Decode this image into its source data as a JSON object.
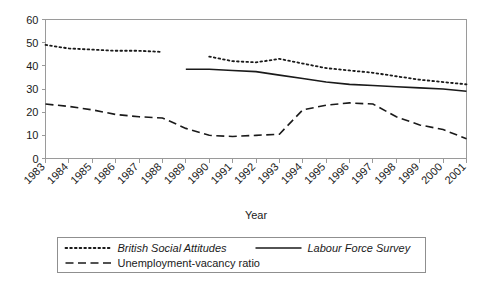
{
  "chart_data": {
    "type": "line",
    "title": "",
    "xlabel": "Year",
    "ylabel": "",
    "grid": false,
    "legend_position": "bottom",
    "x": [
      1983,
      1984,
      1985,
      1986,
      1987,
      1988,
      1989,
      1990,
      1991,
      1992,
      1993,
      1994,
      1995,
      1996,
      1997,
      1998,
      1999,
      2000,
      2001
    ],
    "categories": [
      "1983",
      "1984",
      "1985",
      "1986",
      "1987",
      "1988",
      "1989",
      "1990",
      "1991",
      "1992",
      "1993",
      "1994",
      "1995",
      "1996",
      "1997",
      "1998",
      "1999",
      "2000",
      "2001"
    ],
    "xlim": [
      1983,
      2001
    ],
    "ylim": [
      0,
      60
    ],
    "yticks": [
      0,
      10,
      20,
      30,
      40,
      50,
      60
    ],
    "ytick_labels": [
      "0",
      "10",
      "20",
      "30",
      "40",
      "50",
      "60"
    ],
    "series": [
      {
        "name": "British Social Attitudes",
        "style": "dotted",
        "color": "#1a1a1a",
        "points": [
          {
            "x": 1983,
            "y": 49
          },
          {
            "x": 1984,
            "y": 47.5
          },
          {
            "x": 1985,
            "y": 47
          },
          {
            "x": 1986,
            "y": 46.5
          },
          {
            "x": 1987,
            "y": 46.5
          },
          {
            "x": 1988,
            "y": 46
          },
          {
            "x": 1989,
            "y": null
          },
          {
            "x": 1990,
            "y": 44
          },
          {
            "x": 1991,
            "y": 42
          },
          {
            "x": 1992,
            "y": 41.5
          },
          {
            "x": 1993,
            "y": 43
          },
          {
            "x": 1994,
            "y": 41
          },
          {
            "x": 1995,
            "y": 39
          },
          {
            "x": 1996,
            "y": 38
          },
          {
            "x": 1997,
            "y": 37
          },
          {
            "x": 1998,
            "y": 35.5
          },
          {
            "x": 1999,
            "y": 34
          },
          {
            "x": 2000,
            "y": 33
          },
          {
            "x": 2001,
            "y": 32
          }
        ]
      },
      {
        "name": "Labour Force Survey",
        "style": "solid",
        "color": "#1a1a1a",
        "points": [
          {
            "x": 1983,
            "y": null
          },
          {
            "x": 1984,
            "y": null
          },
          {
            "x": 1985,
            "y": null
          },
          {
            "x": 1986,
            "y": null
          },
          {
            "x": 1987,
            "y": null
          },
          {
            "x": 1988,
            "y": null
          },
          {
            "x": 1989,
            "y": 38.5
          },
          {
            "x": 1990,
            "y": 38.5
          },
          {
            "x": 1991,
            "y": 38
          },
          {
            "x": 1992,
            "y": 37.5
          },
          {
            "x": 1993,
            "y": 36
          },
          {
            "x": 1994,
            "y": 34.5
          },
          {
            "x": 1995,
            "y": 33
          },
          {
            "x": 1996,
            "y": 32
          },
          {
            "x": 1997,
            "y": 31.5
          },
          {
            "x": 1998,
            "y": 31
          },
          {
            "x": 1999,
            "y": 30.5
          },
          {
            "x": 2000,
            "y": 30
          },
          {
            "x": 2001,
            "y": 29
          }
        ]
      },
      {
        "name": "Unemployment-vacancy ratio",
        "style": "dashed",
        "color": "#1a1a1a",
        "points": [
          {
            "x": 1983,
            "y": 23.5
          },
          {
            "x": 1984,
            "y": 22.5
          },
          {
            "x": 1985,
            "y": 21
          },
          {
            "x": 1986,
            "y": 19
          },
          {
            "x": 1987,
            "y": 18
          },
          {
            "x": 1988,
            "y": 17.5
          },
          {
            "x": 1989,
            "y": 13
          },
          {
            "x": 1990,
            "y": 10
          },
          {
            "x": 1991,
            "y": 9.5
          },
          {
            "x": 1992,
            "y": 10
          },
          {
            "x": 1993,
            "y": 10.5
          },
          {
            "x": 1994,
            "y": 21
          },
          {
            "x": 1995,
            "y": 23
          },
          {
            "x": 1996,
            "y": 24
          },
          {
            "x": 1997,
            "y": 23.5
          },
          {
            "x": 1998,
            "y": 18
          },
          {
            "x": 1999,
            "y": 14.5
          },
          {
            "x": 2000,
            "y": 12.5
          },
          {
            "x": 2001,
            "y": 8.5
          }
        ]
      }
    ],
    "legend": [
      {
        "label": "British Social Attitudes",
        "style": "dotted",
        "italic": true
      },
      {
        "label": "Labour Force Survey",
        "style": "solid",
        "italic": true
      },
      {
        "label": "Unemployment-vacancy ratio",
        "style": "dashed",
        "italic": false
      }
    ]
  }
}
